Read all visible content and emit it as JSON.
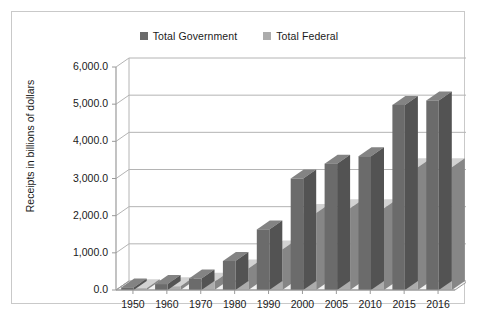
{
  "chart_data": {
    "type": "bar",
    "title": "",
    "xlabel": "",
    "ylabel": "Receipts in billions of dollars",
    "categories": [
      "1950",
      "1960",
      "1970",
      "1980",
      "1990",
      "2000",
      "2005",
      "2010",
      "2015",
      "2016"
    ],
    "series": [
      {
        "name": "Total Government",
        "color": "#6b6b6b",
        "values": [
          70,
          160,
          310,
          780,
          1630,
          3000,
          3400,
          3600,
          4980,
          5100
        ]
      },
      {
        "name": "Total Federal",
        "color": "#acacac",
        "values": [
          50,
          100,
          220,
          580,
          1090,
          2070,
          2200,
          2200,
          3300,
          3300
        ]
      }
    ],
    "ylim": [
      0,
      6000
    ],
    "ytick_values": [
      0,
      1000,
      2000,
      3000,
      4000,
      5000,
      6000
    ],
    "ytick_labels": [
      "0.0",
      "1,000.0",
      "2,000.0",
      "3,000.0",
      "4,000.0",
      "5,000.0",
      "6,000.0"
    ],
    "grid": true,
    "legend_position": "top",
    "style": "3d-perspective-column"
  },
  "legend": {
    "entries": [
      {
        "label": "Total Government",
        "color": "#6b6b6b"
      },
      {
        "label": "Total Federal",
        "color": "#acacac"
      }
    ]
  },
  "colors": {
    "series_dark": "#6b6b6b",
    "series_light": "#acacac",
    "gridline": "#b4b4b4",
    "axis": "#9a9a9a",
    "frame_border": "#c9c9c9",
    "floor": "#f2f2f2",
    "text": "#1a1a1a"
  }
}
